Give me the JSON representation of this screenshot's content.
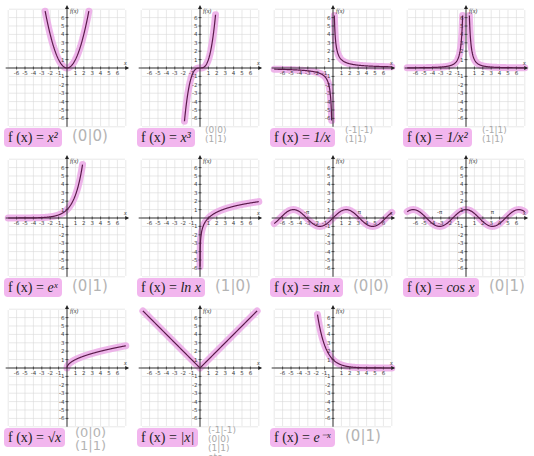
{
  "colors": {
    "curve": "#5a1a4a",
    "highlight": "#eba8e6",
    "formula_bg": "#f2b6ee",
    "grid": "#d8d8d8",
    "axis": "#222222",
    "note": "#aaaaaa"
  },
  "axes": {
    "x_label": "x",
    "y_label": "f(x)",
    "x_ticks": [
      -6,
      -5,
      -4,
      -3,
      -2,
      -1,
      1,
      2,
      3,
      4,
      5,
      6
    ],
    "y_ticks": [
      6,
      5,
      4,
      3,
      2,
      1,
      -1,
      -2,
      -3,
      -4,
      -5,
      -6
    ]
  },
  "panels": [
    {
      "id": "x2",
      "formula_prefix": "f (x) = ",
      "formula_body": "x²",
      "note": "(0|0)",
      "note_size": "big"
    },
    {
      "id": "x3",
      "formula_prefix": "f (x) = ",
      "formula_body": "x³",
      "note": "(0|0)\n(1|1)",
      "note_size": "small"
    },
    {
      "id": "inv",
      "formula_prefix": "f (x) = ",
      "formula_body": "1/x",
      "note": "(-1|-1)\n(1|1)",
      "note_size": "small"
    },
    {
      "id": "inv2",
      "formula_prefix": "f (x) = ",
      "formula_body": "1/x²",
      "note": "(-1|1)\n(1|1)",
      "note_size": "small"
    },
    {
      "id": "exp",
      "formula_prefix": "f (x) = ",
      "formula_body": "eˣ",
      "note": "(0|1)",
      "note_size": "big"
    },
    {
      "id": "ln",
      "formula_prefix": "f (x) = ",
      "formula_body": "ln x",
      "note": "(1|0)",
      "note_size": "big"
    },
    {
      "id": "sin",
      "formula_prefix": "f (x) = ",
      "formula_body": "sin x",
      "note": "(0|0)",
      "note_size": "big"
    },
    {
      "id": "cos",
      "formula_prefix": "f (x) = ",
      "formula_body": "cos x",
      "note": "(0|1)",
      "note_size": "big"
    },
    {
      "id": "sqrt",
      "formula_prefix": "f (x) = ",
      "formula_body": "√x",
      "note": "(0|0)\n(1|1)",
      "note_size": "mid"
    },
    {
      "id": "abs",
      "formula_prefix": "f (x) = ",
      "formula_body": "|x|",
      "note": "(-1|-1)\n(0|0)\n(1|1)\netc.",
      "note_size": "small"
    },
    {
      "id": "expneg",
      "formula_prefix": "f (x) = ",
      "formula_body": "e⁻ˣ",
      "note": "(0|1)",
      "note_size": "big"
    }
  ],
  "chart_data": {
    "type": "line",
    "xlabel": "x",
    "ylabel": "f(x)",
    "xlim": [
      -7,
      7
    ],
    "ylim": [
      -7,
      7
    ],
    "grid": true,
    "series": [
      {
        "name": "f(x) = x^2",
        "x": [
          -2.5,
          -2,
          -1,
          0,
          1,
          2,
          2.5
        ],
        "values": [
          6.25,
          4,
          1,
          0,
          1,
          4,
          6.25
        ],
        "marked_points": [
          [
            0,
            0
          ]
        ]
      },
      {
        "name": "f(x) = x^3",
        "x": [
          -1.8,
          -1,
          0,
          1,
          1.8
        ],
        "values": [
          -5.83,
          -1,
          0,
          1,
          5.83
        ],
        "marked_points": [
          [
            0,
            0
          ],
          [
            1,
            1
          ]
        ]
      },
      {
        "name": "f(x) = 1/x",
        "x": [
          -6,
          -2,
          -1,
          -0.5,
          -0.17,
          0.17,
          0.5,
          1,
          2,
          6
        ],
        "values": [
          -0.17,
          -0.5,
          -1,
          -2,
          -6,
          6,
          2,
          1,
          0.5,
          0.17
        ],
        "marked_points": [
          [
            -1,
            -1
          ],
          [
            1,
            1
          ]
        ]
      },
      {
        "name": "f(x) = 1/x^2",
        "x": [
          -6,
          -2,
          -1,
          -0.5,
          -0.4,
          0.4,
          0.5,
          1,
          2,
          6
        ],
        "values": [
          0.03,
          0.25,
          1,
          4,
          6.25,
          6.25,
          4,
          1,
          0.25,
          0.03
        ],
        "marked_points": [
          [
            -1,
            1
          ],
          [
            1,
            1
          ]
        ]
      },
      {
        "name": "f(x) = e^x",
        "x": [
          -6,
          -3,
          -1,
          0,
          1,
          1.8
        ],
        "values": [
          0.0025,
          0.05,
          0.37,
          1,
          2.72,
          6.05
        ],
        "marked_points": [
          [
            0,
            1
          ]
        ]
      },
      {
        "name": "f(x) = ln x",
        "x": [
          0.003,
          0.1,
          0.5,
          1,
          2,
          4,
          6.5
        ],
        "values": [
          -5.8,
          -2.3,
          -0.69,
          0,
          0.69,
          1.39,
          1.87
        ],
        "marked_points": [
          [
            1,
            0
          ]
        ]
      },
      {
        "name": "f(x) = sin x",
        "x": [
          -6.5,
          -4.71,
          -3.14,
          -1.57,
          0,
          1.57,
          3.14,
          4.71,
          6.5
        ],
        "values": [
          -0.22,
          1,
          0,
          -1,
          0,
          1,
          0,
          -1,
          0.22
        ],
        "marked_points": [
          [
            0,
            0
          ]
        ],
        "annotations": [
          "-π",
          "π"
        ]
      },
      {
        "name": "f(x) = cos x",
        "x": [
          -6.5,
          -3.14,
          -1.57,
          0,
          1.57,
          3.14,
          6.5
        ],
        "values": [
          0.98,
          -1,
          0,
          1,
          0,
          -1,
          0.98
        ],
        "marked_points": [
          [
            0,
            1
          ]
        ],
        "annotations": [
          "-π",
          "π"
        ]
      },
      {
        "name": "f(x) = sqrt(x)",
        "x": [
          0,
          1,
          2,
          4,
          6.5
        ],
        "values": [
          0,
          1,
          1.41,
          2,
          2.55
        ],
        "marked_points": [
          [
            0,
            0
          ],
          [
            1,
            1
          ]
        ]
      },
      {
        "name": "f(x) = |x|",
        "x": [
          -6.5,
          -1,
          0,
          1,
          6.5
        ],
        "values": [
          6.5,
          1,
          0,
          1,
          6.5
        ],
        "marked_points": [
          [
            -1,
            1
          ],
          [
            0,
            0
          ],
          [
            1,
            1
          ]
        ]
      },
      {
        "name": "f(x) = e^-x",
        "x": [
          -1.8,
          -1,
          0,
          1,
          3,
          6
        ],
        "values": [
          6.05,
          2.72,
          1,
          0.37,
          0.05,
          0.0025
        ],
        "marked_points": [
          [
            0,
            1
          ]
        ]
      }
    ]
  }
}
